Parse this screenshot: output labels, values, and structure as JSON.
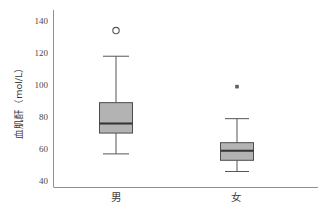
{
  "chart_data": {
    "type": "box",
    "title": "",
    "xlabel": "",
    "ylabel": "血肌酐（mol/L）",
    "ylim": [
      36,
      145
    ],
    "yticks": [
      40,
      60,
      80,
      100,
      120,
      140
    ],
    "ytick_labels": [
      "40",
      "60",
      "80",
      "100",
      "120",
      "140"
    ],
    "categories": [
      "男",
      "女"
    ],
    "grid": false,
    "legend": null,
    "box_fill_color": "#b3b3b3",
    "box_edge_color": "#4d4d4d",
    "median_color": "#333333",
    "whisker_color": "#4d4d4d",
    "axis_color": "#808080",
    "boxes": [
      {
        "category": "男",
        "whisker_low": 57,
        "q1": 70,
        "median": 76,
        "q3": 89,
        "whisker_high": 118,
        "outliers": [
          134
        ],
        "outlier_marker": "circle"
      },
      {
        "category": "女",
        "whisker_low": 46,
        "q1": 53,
        "median": 59,
        "q3": 64,
        "whisker_high": 79,
        "outliers": [
          99
        ],
        "outlier_marker": "asterisk"
      }
    ]
  }
}
